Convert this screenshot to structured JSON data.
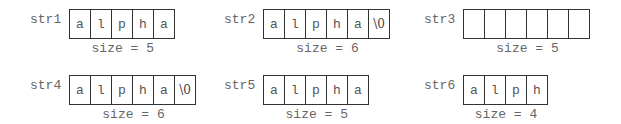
{
  "arrays": [
    {
      "name": "str1",
      "cells": [
        "a",
        "l",
        "p",
        "h",
        "a"
      ],
      "size_label": "size = 5",
      "x": 69,
      "y": 9,
      "label_x": 30,
      "label_y": 12
    },
    {
      "name": "str2",
      "cells": [
        "a",
        "l",
        "p",
        "h",
        "a",
        "\\0"
      ],
      "size_label": "size = 6",
      "x": 263,
      "y": 9,
      "label_x": 224,
      "label_y": 12
    },
    {
      "name": "str3",
      "cells": [
        "",
        "",
        "",
        "",
        "",
        ""
      ],
      "size_label": "size = 5",
      "x": 463,
      "y": 9,
      "label_x": 424,
      "label_y": 12
    },
    {
      "name": "str4",
      "cells": [
        "a",
        "l",
        "p",
        "h",
        "a",
        "\\0"
      ],
      "size_label": "size = 6",
      "x": 69,
      "y": 75,
      "label_x": 30,
      "label_y": 78
    },
    {
      "name": "str5",
      "cells": [
        "a",
        "l",
        "p",
        "h",
        "a"
      ],
      "size_label": "size = 5",
      "x": 263,
      "y": 75,
      "label_x": 224,
      "label_y": 78
    },
    {
      "name": "str6",
      "cells": [
        "a",
        "l",
        "p",
        "h"
      ],
      "size_label": "size = 4",
      "x": 463,
      "y": 75,
      "label_x": 424,
      "label_y": 78
    }
  ]
}
